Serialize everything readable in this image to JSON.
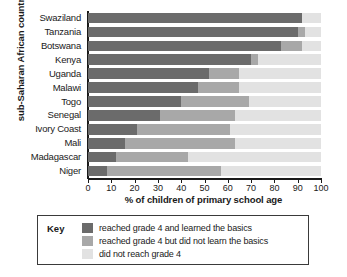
{
  "chart_data": {
    "type": "bar",
    "orientation": "horizontal",
    "stacked": true,
    "title": "",
    "xlabel": "% of children of primary school age",
    "ylabel": "sub-Saharan African country",
    "xlim": [
      0,
      100
    ],
    "xticks": [
      0,
      10,
      20,
      30,
      40,
      50,
      60,
      70,
      80,
      90,
      100
    ],
    "grid": false,
    "legend_position": "bottom",
    "legend_title": "Key",
    "categories": [
      "Swaziland",
      "Tanzania",
      "Botswana",
      "Kenya",
      "Uganda",
      "Malawi",
      "Togo",
      "Senegal",
      "Ivory Coast",
      "Mali",
      "Madagascar",
      "Niger"
    ],
    "series": [
      {
        "name": "reached grade 4 and learned the basics",
        "color": "#6b6b6b",
        "values": [
          92,
          90,
          83,
          70,
          52,
          47,
          40,
          31,
          21,
          16,
          12,
          8
        ]
      },
      {
        "name": "reached grade 4 but did not learn the basics",
        "color": "#a8a8a8",
        "values": [
          0,
          3,
          9,
          3,
          13,
          18,
          29,
          32,
          40,
          47,
          31,
          49
        ]
      },
      {
        "name": "did not reach grade 4",
        "color": "#e2e2e2",
        "values": [
          8,
          7,
          8,
          27,
          35,
          35,
          31,
          37,
          39,
          37,
          57,
          43
        ]
      }
    ],
    "series_totals": [
      100,
      100,
      100,
      100,
      100,
      100,
      100,
      100,
      100,
      100,
      100,
      100
    ]
  }
}
